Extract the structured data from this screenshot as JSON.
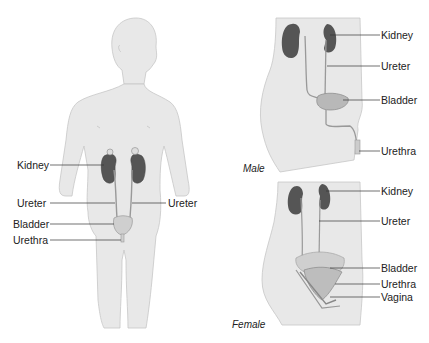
{
  "front_view": {
    "labels": {
      "kidney": "Kidney",
      "ureter_left": "Ureter",
      "ureter_right": "Ureter",
      "bladder": "Bladder",
      "urethra": "Urethra"
    }
  },
  "male_view": {
    "caption": "Male",
    "labels": {
      "kidney": "Kidney",
      "ureter": "Ureter",
      "bladder": "Bladder",
      "urethra": "Urethra"
    }
  },
  "female_view": {
    "caption": "Female",
    "labels": {
      "kidney": "Kidney",
      "ureter": "Ureter",
      "bladder": "Bladder",
      "urethra": "Urethra",
      "vagina": "Vagina"
    }
  },
  "colors": {
    "body_fill": "#e8e8e8",
    "body_outline": "#c8c8c8",
    "kidney": "#555555",
    "bladder": "#b5b5b5",
    "leader_line": "#333333"
  }
}
